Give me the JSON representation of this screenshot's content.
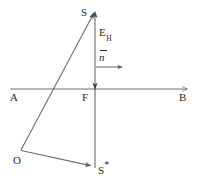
{
  "figure": {
    "width": 198,
    "height": 180,
    "stroke_color": "#6e6e6e",
    "label_color": "#2b2b2b",
    "background": "#ffffff"
  },
  "labels": {
    "source": "S",
    "field": "E",
    "field_subscript": "H",
    "normal": "n",
    "axis_left": "A",
    "focus": "F",
    "axis_right": "B",
    "origin": "O",
    "image": "S",
    "image_star": "*"
  },
  "geometry": {
    "vertical_axis": {
      "x": 95,
      "y_top": 13,
      "y_bottom": 168
    },
    "horizontal_axis": {
      "y": 89,
      "x_left": 10,
      "x_right": 187
    },
    "ray_O_to_S": {
      "x1": 21,
      "y1": 150,
      "x2": 93,
      "y2": 14
    },
    "ray_O_to_Sstar": {
      "x1": 21,
      "y1": 150,
      "x2": 93,
      "y2": 166
    },
    "normal_arrow": {
      "x1": 96,
      "y1": 67,
      "x2": 127,
      "y2": 67
    },
    "focus_point": {
      "x": 95,
      "y": 89
    },
    "origin_point": {
      "x": 21,
      "y": 150
    }
  }
}
